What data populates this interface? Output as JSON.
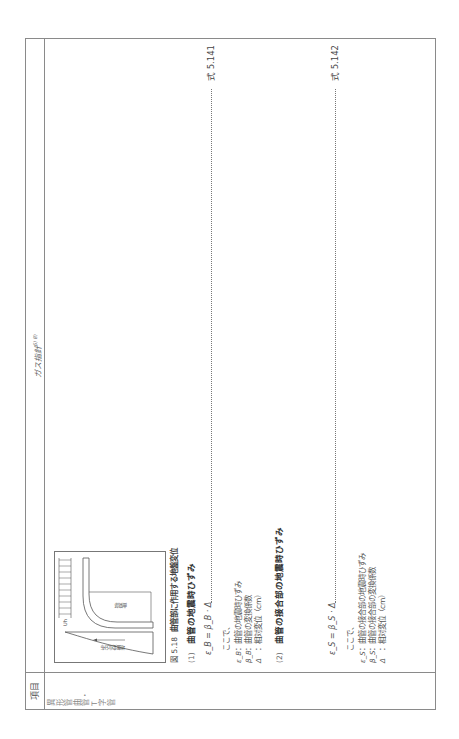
{
  "header": {
    "item_label": "項目",
    "title": "ガス指針",
    "title_refs": "6) 8)"
  },
  "item": {
    "name": "異形管曲管・T字管"
  },
  "figure": {
    "number": "図 5.18",
    "caption": "曲管部に作用する地盤変位",
    "labels": {
      "distribution": "地盤変位分布",
      "bend": "曲管部",
      "uh": "Uh"
    }
  },
  "sections": [
    {
      "number": "(1)",
      "title": "曲管の地震時ひずみ",
      "equation": "ε_B = β_B · Δ",
      "equation_no": "式 5.141",
      "where": "ここで、",
      "definitions": [
        {
          "symbol": "ε_B",
          "text": "：曲管の地震時ひずみ"
        },
        {
          "symbol": "β_B",
          "text": "：曲管の変換係数"
        },
        {
          "symbol": "Δ",
          "text": "：相対変位（cm）"
        }
      ]
    },
    {
      "number": "(2)",
      "title": "曲管の接合部の地震時ひずみ",
      "equation": "ε_S = β_S · Δ",
      "equation_no": "式 5.142",
      "where": "ここで、",
      "definitions": [
        {
          "symbol": "ε_S",
          "text": "：曲管の接合部の地震時ひずみ"
        },
        {
          "symbol": "β_S",
          "text": "：曲管の接合部の変換係数"
        },
        {
          "symbol": "Δ",
          "text": "：相対変位（cm）"
        }
      ]
    }
  ]
}
